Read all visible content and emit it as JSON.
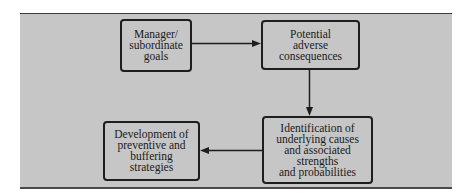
{
  "diagram": {
    "type": "flowchart",
    "colors": {
      "panel_fill": "#c6c6c6",
      "box_border": "#1e1e1e",
      "arrow": "#1e1e1e",
      "text": "#1a1a1a"
    },
    "nodes": [
      {
        "id": "goals",
        "label": "Manager/\nsubordinate\ngoals"
      },
      {
        "id": "consequences",
        "label": "Potential\nadverse\nconsequences"
      },
      {
        "id": "identification",
        "label": "Identification of\nunderlying causes\nand associated\nstrengths\nand probabilities"
      },
      {
        "id": "development",
        "label": "Development of\npreventive and\nbuffering\nstrategies"
      }
    ],
    "edges": [
      {
        "from": "goals",
        "to": "consequences",
        "direction": "right"
      },
      {
        "from": "consequences",
        "to": "identification",
        "direction": "down"
      },
      {
        "from": "identification",
        "to": "development",
        "direction": "left"
      }
    ]
  }
}
